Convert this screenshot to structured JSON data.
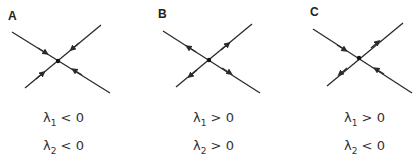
{
  "panels": [
    {
      "label": "A",
      "eq1": {
        "symbol": "λ",
        "sub": "1",
        "rel": "<",
        "val": "0"
      },
      "eq2": {
        "symbol": "λ",
        "sub": "2",
        "rel": "<",
        "val": "0"
      },
      "type": "stable node (all trajectories inward)"
    },
    {
      "label": "B",
      "eq1": {
        "symbol": "λ",
        "sub": "1",
        "rel": ">",
        "val": "0"
      },
      "eq2": {
        "symbol": "λ",
        "sub": "2",
        "rel": ">",
        "val": "0"
      },
      "type": "unstable node (all trajectories outward)"
    },
    {
      "label": "C",
      "eq1": {
        "symbol": "λ",
        "sub": "1",
        "rel": ">",
        "val": "0"
      },
      "eq2": {
        "symbol": "λ",
        "sub": "2",
        "rel": "<",
        "val": "0"
      },
      "type": "saddle point"
    }
  ],
  "colors": {
    "line": "#2b2b2b",
    "text": "#333333"
  }
}
